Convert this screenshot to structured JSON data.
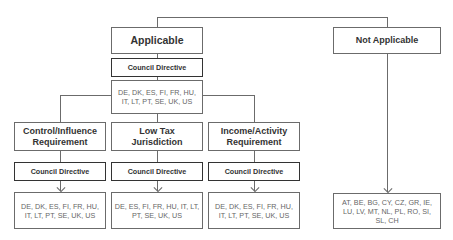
{
  "diagram": {
    "root": {
      "applicable": {
        "label": "Applicable",
        "directive": "Council Directive",
        "countries": "DE, DK, ES, FI, FR, HU, IT, LT, PT, SE, UK, US"
      },
      "not_applicable": {
        "label": "Not Applicable",
        "countries": "AT, BE, BG, CY, CZ, GR, IE, LU, LV, MT, NL, PL, RO, SI, SL, CH"
      }
    },
    "requirements": [
      {
        "label": "Control/Influence Requirement",
        "directive": "Council Directive",
        "countries": "DE, DK, ES, FI, FR, HU, IT, LT, PT, SE, UK, US"
      },
      {
        "label": "Low Tax Jurisdiction",
        "directive": "Council Directive",
        "countries": "DE, ES, FI, FR, HU, IT, LT, PT, SE, UK, US"
      },
      {
        "label": "Income/Activity Requirement",
        "directive": "Council Directive",
        "countries": "DE, DK, ES, FI, FR, HU, IT, LT, PT, SE, UK, US"
      }
    ]
  }
}
